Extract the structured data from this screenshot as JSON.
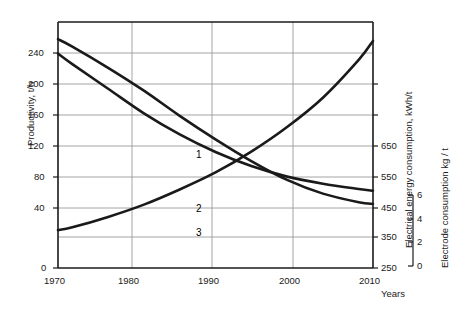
{
  "chart_data": {
    "type": "line",
    "title": "",
    "xlabel": "Years",
    "x_ticks": [
      1970,
      1980,
      1990,
      2000,
      2010
    ],
    "xlim": [
      1968,
      2012
    ],
    "grid": true,
    "legend": "inline-numeric-labels",
    "axes": [
      {
        "id": "left",
        "label": "Productivity, t/h",
        "ticks": [
          0,
          40,
          80,
          120,
          160,
          200,
          240
        ],
        "lim": [
          0,
          260
        ],
        "position": "left"
      },
      {
        "id": "right-energy",
        "label": "Electrical energy consumption, kWh/t",
        "ticks": [
          250,
          350,
          450,
          550,
          650
        ],
        "lim": [
          250,
          680
        ],
        "position": "right"
      },
      {
        "id": "right-electrode",
        "label": "Electrode consumption kg / t",
        "ticks": [
          0,
          2,
          4,
          6
        ],
        "lim": [
          0,
          7
        ],
        "position": "far-right"
      }
    ],
    "series": [
      {
        "name": "1",
        "curve_label": "1",
        "axis": "left",
        "description": "Productivity rising",
        "x": [
          1968,
          1970,
          1975,
          1980,
          1985,
          1990,
          1995,
          2000,
          2005,
          2010,
          2012
        ],
        "values": [
          40,
          43,
          54,
          67,
          83,
          101,
          123,
          149,
          180,
          220,
          240
        ]
      },
      {
        "name": "2",
        "curve_label": "2",
        "axis": "right-energy",
        "description": "Electrical energy consumption falling",
        "x": [
          1968,
          1970,
          1975,
          1980,
          1985,
          1990,
          1995,
          2000,
          2005,
          2010,
          2012
        ],
        "values": [
          650,
          637,
          600,
          560,
          516,
          475,
          437,
          404,
          380,
          365,
          362
        ]
      },
      {
        "name": "3",
        "curve_label": "3",
        "axis": "right-electrode",
        "description": "Electrode consumption falling",
        "x": [
          1968,
          1970,
          1975,
          1980,
          1985,
          1990,
          1995,
          2000,
          2005,
          2010,
          2012
        ],
        "values": [
          6.1,
          5.8,
          5.1,
          4.4,
          3.8,
          3.3,
          2.9,
          2.6,
          2.4,
          2.25,
          2.2
        ]
      }
    ],
    "colors": {
      "curve": "#1a1a1a",
      "grid": "#999999",
      "axis": "#1a1a1a",
      "background": "#ffffff"
    }
  },
  "axis_labels": {
    "left_title": "Productivity, t/h",
    "right_energy_title": "Electrical energy consumption,  kWh/t",
    "right_electrode_title": "Electrode consumption kg / t",
    "x_title": "Years"
  },
  "ticks": {
    "left": [
      "240",
      "200",
      "160",
      "120",
      "80",
      "40",
      "0"
    ],
    "bottom": [
      "1970",
      "1980",
      "1990",
      "2000",
      "2010"
    ],
    "right_energy": [
      "650",
      "550",
      "450",
      "350",
      "250"
    ],
    "right_electrode": [
      "6",
      "4",
      "2",
      "0"
    ]
  },
  "curve_labels": {
    "one": "1",
    "two": "2",
    "three": "3"
  }
}
